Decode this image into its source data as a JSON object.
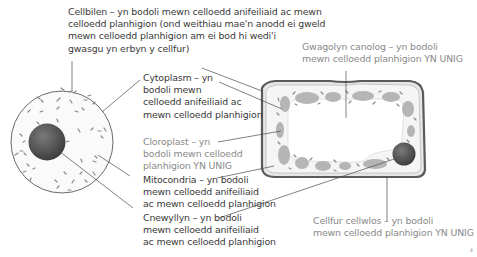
{
  "diagram": {
    "type": "animal-and-plant-cell-labelled",
    "animal_cell": {
      "label": "animal-cell"
    },
    "plant_cell": {
      "label": "plant-cell"
    }
  },
  "labels": {
    "cellbilen": "Cellbilen – yn bodoli mewn celloedd anifeiliaid ac mewn\ncelloedd planhigion (ond weithiau mae'n anodd ei gweld\nmewn celloedd planhigion am ei bod hi wedi'i\ngwasgu yn erbyn y cellfur)",
    "gwagolyn": "Gwagolyn canolog – yn bodoli\nmewn celloedd planhigion YN UNIG",
    "cytoplasm": "Cytoplasm – yn\nbodoli mewn\ncelloedd anifeiliaid ac\nmewn celloedd planhigion",
    "cloroplast": "Cloroplast – yn\nbodoli mewn celloedd\nplanhigion YN UNIG",
    "mitocondria": "Mitocondria – yn bodoli\nmewn celloedd anifeiliaid\nac mewn celloedd planhigion",
    "cnewyllyn": "Cnewyllyn – yn bodoli\nmewn celloedd anifeiliaid\nac mewn celloedd planhigion",
    "cellfur": "Cellfur cellwlos – yn bodoli\nmewn celloedd planhigion YN UNIG"
  },
  "page_number": "4",
  "colors": {
    "text_dark": "#3a3a3a",
    "text_grey": "#8a8a8a",
    "cell_outline": "#5a5a5a",
    "nucleus": "#555555",
    "chloroplast": "#b8b8b8",
    "cytoplasm_fill": "#f4f4f4"
  }
}
